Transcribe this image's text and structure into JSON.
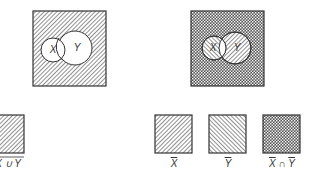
{
  "figure": {
    "colors": {
      "stroke": "#333333",
      "hatch": "#555555",
      "background": "#ffffff"
    },
    "left_diagram": {
      "description": "complement of X union Y",
      "circle_x_label": "X",
      "circle_y_label": "Y"
    },
    "right_diagram": {
      "description": "X-bar intersect Y-bar",
      "circle_x_label": "X",
      "circle_y_label": "Y"
    },
    "legend": [
      {
        "label_main": "X ∪ Y",
        "overline": true,
        "pattern": "forward-hatch"
      },
      {
        "label_main": "X",
        "overline": true,
        "pattern": "forward-hatch"
      },
      {
        "label_main": "Y",
        "overline": true,
        "pattern": "back-hatch"
      },
      {
        "label_a": "X",
        "op": " ∩ ",
        "label_b": "Y",
        "overline_each": true,
        "pattern": "crosshatch"
      }
    ]
  }
}
